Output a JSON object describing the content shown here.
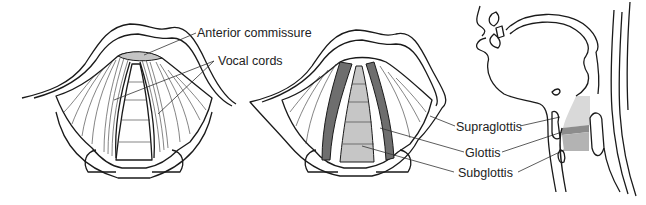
{
  "figure": {
    "panels": [
      {
        "id": "larynx-unshaded",
        "description": "Superior view of larynx, line drawing"
      },
      {
        "id": "larynx-shaded",
        "description": "Superior view of larynx, shaded regions"
      },
      {
        "id": "head-neck-sagittal",
        "description": "Sagittal head and neck with larynx regions shaded"
      }
    ],
    "labels": {
      "anterior_commissure": "Anterior commissure",
      "vocal_cords": "Vocal cords",
      "supraglottis": "Supraglottis",
      "glottis": "Glottis",
      "subglottis": "Subglottis"
    },
    "colors": {
      "line": "#1a1a1a",
      "supraglottis_fill": "#d9d9d9",
      "glottis_fill": "#8c8c8c",
      "subglottis_fill": "#b3b3b3",
      "panel2_base": "#dcdcdc",
      "panel2_cords": "#6e6e6e",
      "commissure_fill": "#bdbdbd"
    }
  }
}
